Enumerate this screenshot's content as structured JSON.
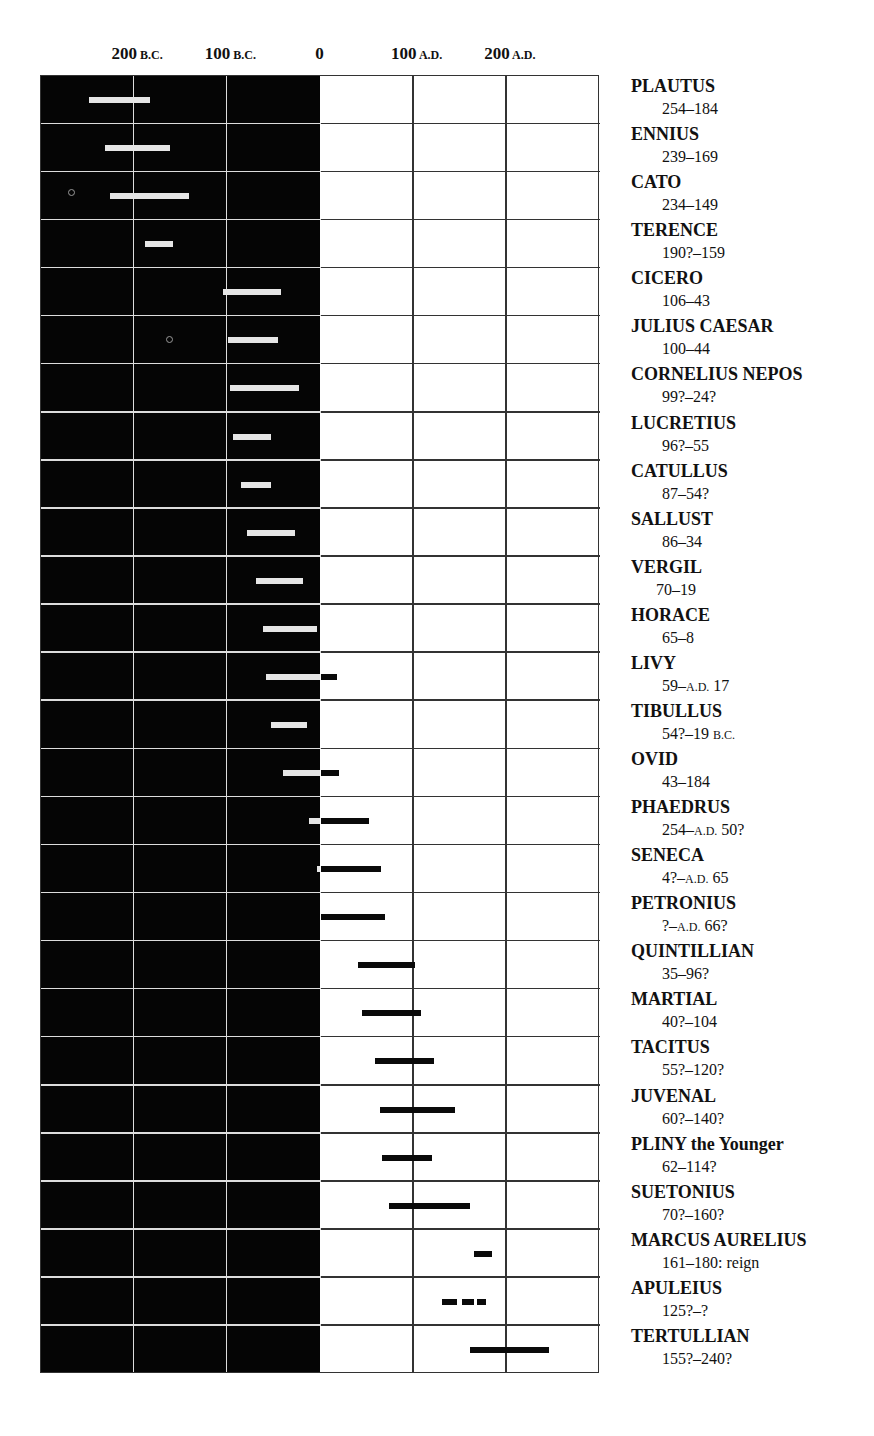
{
  "title_remnant": "",
  "axis": {
    "ticks": [
      {
        "num": "200",
        "era": "B.C.",
        "year": -200
      },
      {
        "num": "100",
        "era": "B.C.",
        "year": -100
      },
      {
        "num": "0",
        "era": "",
        "year": 0
      },
      {
        "num": "100",
        "era": "A.D.",
        "year": 100
      },
      {
        "num": "200",
        "era": "A.D.",
        "year": 200
      }
    ],
    "range": [
      -300,
      300
    ]
  },
  "colors": {
    "bc_background": "#050505",
    "ad_background": "#ffffff",
    "bc_bar": "#e6e6e6",
    "ad_bar": "#0a0a0a",
    "bc_grid": "#dddddd",
    "ad_grid": "#333333"
  },
  "authors": [
    {
      "name": "PLAUTUS",
      "dates": "254–184"
    },
    {
      "name": "ENNIUS",
      "dates": "239–169"
    },
    {
      "name": "CATO",
      "dates": "234–149"
    },
    {
      "name": "TERENCE",
      "dates": "190?–159"
    },
    {
      "name": "CICERO",
      "dates": "106–43"
    },
    {
      "name": "JULIUS CAESAR",
      "dates": "100–44"
    },
    {
      "name": "CORNELIUS NEPOS",
      "dates": "99?–24?"
    },
    {
      "name": "LUCRETIUS",
      "dates": "96?–55"
    },
    {
      "name": "CATULLUS",
      "dates": "87–54?"
    },
    {
      "name": "SALLUST",
      "dates": "86–34"
    },
    {
      "name": "VERGIL",
      "dates": "70–19"
    },
    {
      "name": "HORACE",
      "dates": "65–8"
    },
    {
      "name": "LIVY",
      "dates": "59–A.D. 17"
    },
    {
      "name": "TIBULLUS",
      "dates": "54?–19 B.C."
    },
    {
      "name": "OVID",
      "dates": "43–184"
    },
    {
      "name": "PHAEDRUS",
      "dates": "254–A.D. 50?"
    },
    {
      "name": "SENECA",
      "dates": "4?–A.D.  65"
    },
    {
      "name": "PETRONIUS",
      "dates": "?–A.D. 66?"
    },
    {
      "name": "QUINTILLIAN",
      "dates": "35–96?"
    },
    {
      "name": "MARTIAL",
      "dates": "40?–104"
    },
    {
      "name": "TACITUS",
      "dates": "55?–120?"
    },
    {
      "name": "JUVENAL",
      "dates": "60?–140?"
    },
    {
      "name": "PLINY the Younger",
      "dates": "62–114?"
    },
    {
      "name": "SUETONIUS",
      "dates": "70?–160?"
    },
    {
      "name": "MARCUS AURELIUS",
      "dates": "161–180: reign"
    },
    {
      "name": "APULEIUS",
      "dates": "125?–?"
    },
    {
      "name": "TERTULLIAN",
      "dates": "155?–240?"
    }
  ],
  "chart_data": {
    "type": "timeline",
    "title": "",
    "xlabel": "",
    "ylabel": "",
    "x_ticks": [
      "200 B.C.",
      "100 B.C.",
      "0",
      "100 A.D.",
      "200 A.D."
    ],
    "xlim": [
      -300,
      300
    ],
    "grid": true,
    "legend_position": "right",
    "note": "Years negative = B.C., positive = A.D. Bar spans as drawn on chart (approximate).",
    "series": [
      {
        "name": "PLAUTUS",
        "label": "254–184",
        "start": -249,
        "end": -183
      },
      {
        "name": "ENNIUS",
        "label": "239–169",
        "start": -231,
        "end": -162
      },
      {
        "name": "CATO",
        "label": "234–149",
        "start": -226,
        "end": -141
      },
      {
        "name": "TERENCE",
        "label": "190?–159",
        "start": -188,
        "end": -158
      },
      {
        "name": "CICERO",
        "label": "106–43",
        "start": -105,
        "end": -42
      },
      {
        "name": "JULIUS CAESAR",
        "label": "100–44",
        "start": -99,
        "end": -46
      },
      {
        "name": "CORNELIUS NEPOS",
        "label": "99?–24?",
        "start": -97,
        "end": -23
      },
      {
        "name": "LUCRETIUS",
        "label": "96?–55",
        "start": -94,
        "end": -53
      },
      {
        "name": "CATULLUS",
        "label": "87–54?",
        "start": -85,
        "end": -53
      },
      {
        "name": "SALLUST",
        "label": "86–34",
        "start": -79,
        "end": -27
      },
      {
        "name": "VERGIL",
        "label": "70–19",
        "start": -69,
        "end": -19
      },
      {
        "name": "HORACE",
        "label": "65–8",
        "start": -62,
        "end": -4
      },
      {
        "name": "LIVY",
        "label": "59–A.D. 17",
        "start": -58,
        "end": 18
      },
      {
        "name": "TIBULLUS",
        "label": "54?–19 B.C.",
        "start": -53,
        "end": -15
      },
      {
        "name": "OVID",
        "label": "43–184",
        "start": -40,
        "end": 20
      },
      {
        "name": "PHAEDRUS",
        "label": "254–A.D. 50?",
        "start": -12,
        "end": 52
      },
      {
        "name": "SENECA",
        "label": "4?–A.D.  65",
        "start": -4,
        "end": 65
      },
      {
        "name": "PETRONIUS",
        "label": "?–A.D. 66?",
        "start": 0,
        "end": 69
      },
      {
        "name": "QUINTILLIAN",
        "label": "35–96?",
        "start": 40,
        "end": 101
      },
      {
        "name": "MARTIAL",
        "label": "40?–104",
        "start": 45,
        "end": 108
      },
      {
        "name": "TACITUS",
        "label": "55?–120?",
        "start": 59,
        "end": 122
      },
      {
        "name": "JUVENAL",
        "label": "60?–140?",
        "start": 64,
        "end": 144
      },
      {
        "name": "PLINY the Younger",
        "label": "62–114?",
        "start": 66,
        "end": 120
      },
      {
        "name": "SUETONIUS",
        "label": "70?–160?",
        "start": 73,
        "end": 161
      },
      {
        "name": "MARCUS AURELIUS",
        "label": "161–180: reign",
        "start": 165,
        "end": 184
      },
      {
        "name": "APULEIUS",
        "label": "125?–?",
        "start": 130,
        "end": 178,
        "style": "dashed"
      },
      {
        "name": "TERTULLIAN",
        "label": "155?–240?",
        "start": 161,
        "end": 245
      }
    ]
  }
}
